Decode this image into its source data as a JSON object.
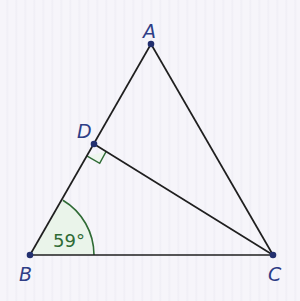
{
  "diagram": {
    "type": "triangle",
    "points": {
      "A": {
        "label": "A",
        "x": 151,
        "y": 44
      },
      "B": {
        "label": "B",
        "x": 30,
        "y": 255
      },
      "C": {
        "label": "C",
        "x": 273,
        "y": 255
      },
      "D": {
        "label": "D",
        "x": 94,
        "y": 144
      }
    },
    "segments": [
      "AB",
      "AC",
      "BC",
      "DC"
    ],
    "right_angle_at": "D",
    "angle_mark": {
      "vertex": "B",
      "label": "59°",
      "fill": "#eaf4ea",
      "stroke": "#2f6b35"
    },
    "colors": {
      "line": "#1f1f1f",
      "point": "#23306f",
      "label": "#2f3e86",
      "angle": "#2f6b35",
      "right_angle": "#2f6b35"
    }
  }
}
